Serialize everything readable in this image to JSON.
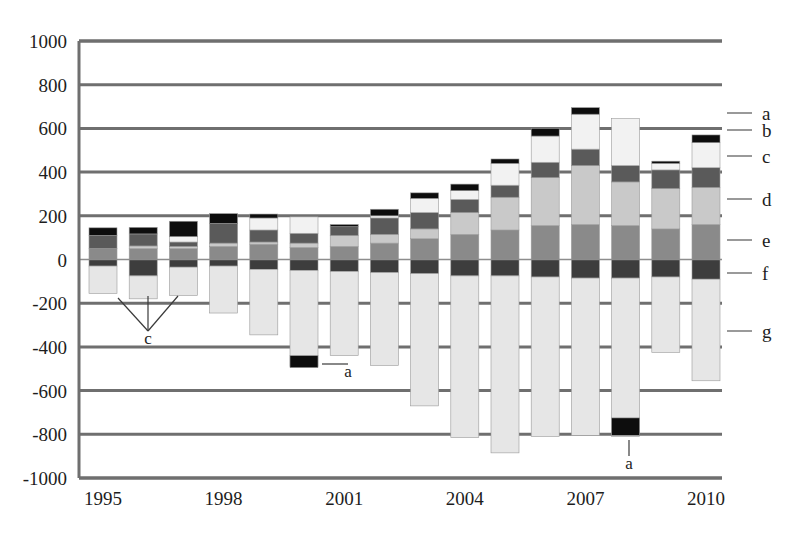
{
  "chart_data": {
    "type": "bar",
    "subtype": "stacked-bar-with-negative",
    "title": "",
    "xlabel": "",
    "ylabel": "",
    "ylim": [
      -1000,
      1000
    ],
    "ytick_step": 200,
    "grid": true,
    "legend_position": "right",
    "x": [
      "1995",
      "1996",
      "1997",
      "1998",
      "1999",
      "2000",
      "2001",
      "2002",
      "2003",
      "2004",
      "2005",
      "2006",
      "2007",
      "2008",
      "2009",
      "2010"
    ],
    "xtick_labels": [
      "1995",
      "1998",
      "2001",
      "2004",
      "2007",
      "2010"
    ],
    "xtick_indices": [
      0,
      3,
      6,
      9,
      12,
      15
    ],
    "ytick_labels": [
      "1000",
      "800",
      "600",
      "400",
      "200",
      "0",
      "-200",
      "-400",
      "-600",
      "-800",
      "-1000"
    ],
    "ytick_values": [
      1000,
      800,
      600,
      400,
      200,
      0,
      -200,
      -400,
      -600,
      -800,
      -1000
    ],
    "series": [
      {
        "name": "a",
        "color": "#0d0d0d",
        "values": [
          35,
          30,
          70,
          45,
          18,
          0,
          10,
          30,
          25,
          30,
          20,
          35,
          30,
          0,
          10,
          35
        ]
      },
      {
        "name": "b",
        "color": "#f2f2f2",
        "values": [
          0,
          0,
          25,
          0,
          55,
          75,
          0,
          10,
          65,
          40,
          100,
          120,
          160,
          215,
          30,
          115
        ]
      },
      {
        "name": "c",
        "color": "#5a5a5a",
        "values": [
          60,
          55,
          20,
          90,
          55,
          45,
          40,
          75,
          75,
          60,
          55,
          70,
          75,
          75,
          85,
          90
        ]
      },
      {
        "name": "d",
        "color": "#c9c9c9",
        "values": [
          0,
          12,
          10,
          15,
          10,
          20,
          50,
          40,
          45,
          100,
          150,
          220,
          270,
          200,
          185,
          170
        ]
      },
      {
        "name": "e",
        "color": "#8a8a8a",
        "values": [
          50,
          50,
          50,
          60,
          70,
          55,
          60,
          75,
          95,
          115,
          135,
          155,
          160,
          155,
          140,
          160
        ]
      },
      {
        "name": "f",
        "color": "#3d3d3d",
        "values": [
          -30,
          -75,
          -35,
          -30,
          -45,
          -50,
          -55,
          -60,
          -65,
          -75,
          -75,
          -80,
          -85,
          -85,
          -80,
          -90
        ]
      },
      {
        "name": "g",
        "color": "#e6e6e6",
        "values": [
          -125,
          -105,
          -130,
          -215,
          -300,
          -440,
          -385,
          -425,
          -605,
          -740,
          -810,
          -730,
          -720,
          -725,
          -345,
          -465
        ]
      }
    ],
    "extra_black_segments": [
      {
        "x_index": 5,
        "from": -440,
        "to": -495,
        "series": "a"
      },
      {
        "x_index": 13,
        "from": -725,
        "to": -805,
        "series": "a"
      }
    ],
    "callouts": [
      {
        "label": "c",
        "x": 148,
        "y": 344,
        "targets": [
          [
            118,
            298
          ],
          [
            148,
            296
          ],
          [
            178,
            296
          ]
        ]
      },
      {
        "label": "a",
        "x": 348,
        "y": 377,
        "targets": [
          [
            322,
            364
          ]
        ]
      },
      {
        "label": "a",
        "x": 629,
        "y": 469,
        "targets": [
          [
            629,
            440
          ]
        ]
      }
    ],
    "legend_items": [
      {
        "label": "a",
        "tick_y": 113
      },
      {
        "label": "b",
        "tick_y": 130
      },
      {
        "label": "c",
        "tick_y": 156
      },
      {
        "label": "d",
        "tick_y": 199
      },
      {
        "label": "e",
        "tick_y": 240
      },
      {
        "label": "f",
        "tick_y": 273
      },
      {
        "label": "g",
        "tick_y": 331
      }
    ]
  },
  "colors": {
    "series_a": "#0d0d0d",
    "series_b": "#f2f2f2",
    "series_c": "#5a5a5a",
    "series_d": "#c9c9c9",
    "series_e": "#8a8a8a",
    "series_f": "#3d3d3d",
    "series_g": "#e6e6e6",
    "gridline": "#6f6f6f",
    "axis": "#6f6f6f",
    "text": "#1d1d1d",
    "background": "#ffffff"
  },
  "geometry": {
    "plot_left": 79,
    "plot_right": 722,
    "plot_top": 41,
    "plot_bottom": 478,
    "zero_y": 259.5,
    "bar_pitch": 40.2,
    "bar_width": 28,
    "first_bar_center": 103,
    "legend_tick_x1": 727,
    "legend_tick_x2": 752,
    "legend_label_x": 762
  }
}
